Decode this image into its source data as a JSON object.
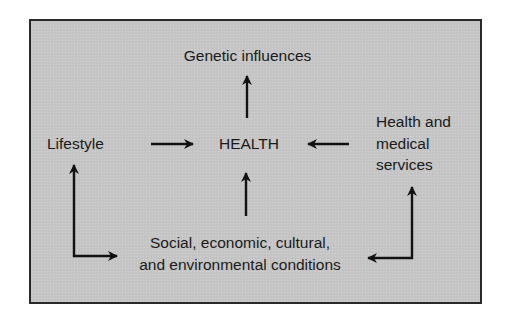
{
  "diagram": {
    "nodes": {
      "genetic": {
        "label": "Genetic influences"
      },
      "health": {
        "label": "HEALTH"
      },
      "lifestyle": {
        "label": "Lifestyle"
      },
      "services": {
        "lines": [
          "Health and",
          "medical",
          "services"
        ]
      },
      "conditions": {
        "lines": [
          "Social, economic, cultural,",
          "and environmental conditions"
        ]
      }
    },
    "edges": [
      {
        "from": "health",
        "to": "genetic",
        "direction": "up"
      },
      {
        "from": "lifestyle",
        "to": "health",
        "direction": "right"
      },
      {
        "from": "services",
        "to": "health",
        "direction": "left"
      },
      {
        "from": "conditions",
        "to": "health",
        "direction": "up"
      },
      {
        "from": "conditions",
        "to": "lifestyle",
        "shape": "elbow",
        "note": "bidirectional"
      },
      {
        "from": "conditions",
        "to": "services",
        "shape": "elbow",
        "note": "bidirectional"
      }
    ],
    "colors": {
      "panel_fill": "#c6c6c6",
      "border": "#2a2a2a",
      "ink": "#1a1a1a",
      "page_background": "#ffffff"
    }
  }
}
